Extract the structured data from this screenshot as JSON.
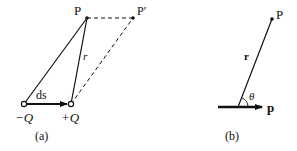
{
  "diagram_a": {
    "point_P": "P",
    "point_P_prime": "P′",
    "vector_r": "r",
    "displacement": "ds",
    "charge_neg": "−Q",
    "charge_pos": "+Q",
    "caption": "(a)"
  },
  "diagram_b": {
    "point_P": "P",
    "vector_r": "r",
    "angle": "θ",
    "dipole_moment": "p",
    "caption": "(b)"
  }
}
